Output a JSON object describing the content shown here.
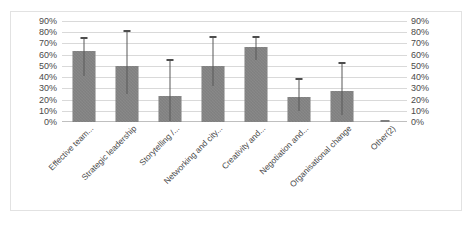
{
  "chart_data": {
    "type": "bar",
    "title": "",
    "subtitle": "",
    "xlabel": "",
    "ylabel": "",
    "ylim": [
      0,
      90
    ],
    "grid": true,
    "legend": "none",
    "dual_axis": true,
    "axis_tick_labels": [
      "90%",
      "80%",
      "70%",
      "60%",
      "50%",
      "40%",
      "30%",
      "20%",
      "10%",
      "0%"
    ],
    "axis_tick_values": [
      90,
      80,
      70,
      60,
      50,
      40,
      30,
      20,
      10,
      0
    ],
    "categories": [
      "Effective team...",
      "Strategic leadership",
      "Storytelling /...",
      "Networking and city...",
      "Creativity and...",
      "Negotiation and...",
      "Organisational change",
      "Other(2)"
    ],
    "values": [
      63,
      50,
      23,
      50,
      67,
      22,
      28,
      0
    ],
    "error_high": [
      75,
      81,
      55,
      76,
      76,
      38,
      53,
      0
    ],
    "error_low": [
      41,
      25,
      1,
      32,
      55,
      10,
      6,
      0
    ],
    "series": [
      {
        "name": "Percentage",
        "values": [
          63,
          50,
          23,
          50,
          67,
          22,
          28,
          0
        ]
      }
    ],
    "colors": {
      "bar": "#7f7f7f",
      "gridline": "#d9d9d9",
      "error": "#595959",
      "border": "#e2e2e2",
      "text": "#4a4a4a",
      "background": "#ffffff"
    }
  }
}
